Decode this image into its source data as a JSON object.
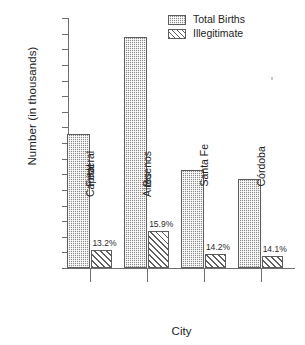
{
  "chart_data": {
    "type": "bar",
    "title": "",
    "xlabel": "City",
    "ylabel": "Number (in thousands)",
    "categories": [
      "Federal Capital",
      "Buenos Aires",
      "Santa Fe",
      "Córdoba"
    ],
    "category_lines": [
      [
        "Federal",
        "Capital"
      ],
      [
        "Buenos",
        "Aires"
      ],
      [
        "Santa Fe"
      ],
      [
        "Córdoba"
      ]
    ],
    "series": [
      {
        "name": "Total Births",
        "values": [
          43,
          74,
          31.5,
          28.5
        ]
      },
      {
        "name": "Illegitimate",
        "values": [
          5.7,
          11.8,
          4.5,
          4.0
        ]
      }
    ],
    "point_labels": [
      "13.2%",
      "15.9%",
      "14.2%",
      "14.1%"
    ],
    "ylim": [
      0,
      80
    ],
    "ytick_step": 5,
    "ytick_labels": [
      "80",
      "75",
      "70",
      "65",
      "60",
      "55",
      "50",
      "45",
      "40",
      "35",
      "30",
      "25",
      "20",
      "15",
      "10",
      "5",
      "0"
    ],
    "grid": false,
    "legend_position": "top-right",
    "colors": {
      "total_births_fill": "#8a8a8a",
      "illegitimate_fill": "#ffffff",
      "outline": "#5d5d5d",
      "axis": "#6f6f6f",
      "text": "#232323"
    }
  },
  "legend": {
    "entries": [
      {
        "label": "Total Births"
      },
      {
        "label": "Illegitimate"
      }
    ]
  },
  "axes": {
    "y_title": "Number (in thousands)",
    "x_title": "City"
  }
}
